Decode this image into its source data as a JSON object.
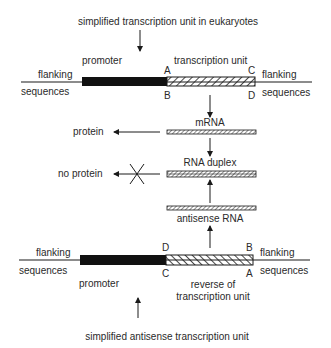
{
  "diagram": {
    "top_title": "simplified transcription unit in eukaryotes",
    "bottom_title": "simplified antisense transcription unit",
    "top_unit": {
      "promoter_label": "promoter",
      "unit_label": "transcription unit",
      "left_flank": [
        "flanking",
        "sequences"
      ],
      "right_flank": [
        "flanking",
        "sequences"
      ],
      "corner_labels": {
        "top_left": "A",
        "bottom_left": "B",
        "top_right": "C",
        "bottom_right": "D"
      }
    },
    "middle": {
      "mrna_label": "mRNA",
      "protein_label": "protein",
      "duplex_label": "RNA duplex",
      "no_protein_label": "no protein",
      "antisense_label": "antisense RNA"
    },
    "bottom_unit": {
      "promoter_label": "promoter",
      "unit_label_line1": "reverse of",
      "unit_label_line2": "transcription unit",
      "left_flank": [
        "flanking",
        "sequences"
      ],
      "right_flank": [
        "flanking",
        "sequences"
      ],
      "corner_labels": {
        "top_left": "D",
        "bottom_left": "C",
        "top_right": "B",
        "bottom_right": "A"
      }
    },
    "colors": {
      "ink": "#1a1a1a",
      "text": "#2a2a2a",
      "background": "#ffffff"
    }
  }
}
